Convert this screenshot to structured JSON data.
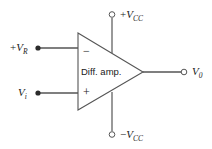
{
  "figure": {
    "type": "circuit-schematic",
    "background_color": "#ffffff",
    "line_color": "#4a4a4a",
    "text_color": "#1a1a1a"
  },
  "amplifier": {
    "block_label": "Diff. amp.",
    "inverting_sign": "−",
    "noninverting_sign": "+",
    "shape": "triangle"
  },
  "terminals": {
    "reference_input": {
      "label_prefix": "+",
      "label_symbol": "V",
      "label_subscript": "R",
      "terminal_style": "filled-dot",
      "input_polarity": "inverting"
    },
    "signal_input": {
      "label_prefix": "",
      "label_symbol": "V",
      "label_subscript": "i",
      "terminal_style": "filled-dot",
      "input_polarity": "non-inverting"
    },
    "positive_supply": {
      "label_prefix": "+",
      "label_symbol": "V",
      "label_subscript": "CC",
      "terminal_style": "open-circle"
    },
    "negative_supply": {
      "label_prefix": "−",
      "label_symbol": "V",
      "label_subscript": "CC",
      "terminal_style": "open-circle"
    },
    "output": {
      "label_prefix": "",
      "label_symbol": "V",
      "label_subscript": "0",
      "terminal_style": "open-circle"
    }
  }
}
